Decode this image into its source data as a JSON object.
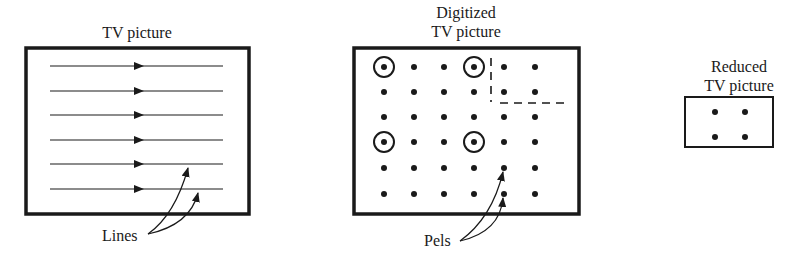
{
  "panels": {
    "tv_picture": {
      "title": "TV picture",
      "callout": "Lines",
      "line_count": 6
    },
    "digitized": {
      "title_line1": "Digitized",
      "title_line2": "TV picture",
      "callout": "Pels",
      "grid": {
        "rows": 6,
        "cols": 6
      },
      "circled_pels": [
        [
          0,
          0
        ],
        [
          0,
          3
        ],
        [
          3,
          0
        ],
        [
          3,
          3
        ]
      ]
    },
    "reduced": {
      "title_line1": "Reduced",
      "title_line2": "TV picture",
      "grid": {
        "rows": 2,
        "cols": 2
      }
    }
  },
  "colors": {
    "ink": "#1a1a1a",
    "background": "#ffffff"
  }
}
